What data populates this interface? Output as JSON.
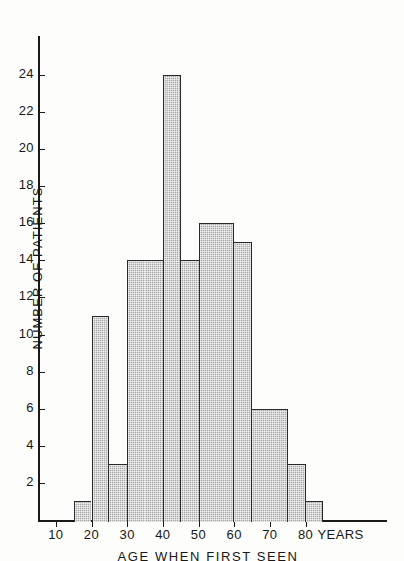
{
  "chart_data": {
    "type": "bar",
    "title": "",
    "subtitle": "",
    "xlabel": "AGE  WHEN  FIRST  SEEN",
    "ylabel": "NUMBER OF PATIENTS",
    "x_unit_label": "YEARS",
    "xlim": [
      5,
      85
    ],
    "ylim": [
      0,
      25
    ],
    "grid": false,
    "legend": null,
    "bin_width": 5,
    "categories": [
      "15-20",
      "20-25",
      "25-30",
      "30-35",
      "35-40",
      "40-45",
      "45-50",
      "50-55",
      "55-60",
      "60-65",
      "65-70",
      "70-75",
      "75-80",
      "80-85"
    ],
    "bin_starts": [
      15,
      20,
      25,
      30,
      35,
      40,
      45,
      50,
      55,
      60,
      65,
      70,
      75,
      80
    ],
    "values": [
      1,
      11,
      3,
      14,
      14,
      24,
      14,
      16,
      16,
      15,
      6,
      6,
      3,
      1
    ],
    "x_ticks": [
      10,
      20,
      30,
      40,
      50,
      60,
      70,
      80
    ],
    "x_tick_labels": [
      "10",
      "20",
      "30",
      "40",
      "50",
      "60",
      "70",
      "80"
    ],
    "y_ticks": [
      2,
      4,
      6,
      8,
      10,
      12,
      14,
      16,
      18,
      20,
      22,
      24
    ],
    "y_tick_labels": [
      "2",
      "4",
      "6",
      "8",
      "10",
      "12",
      "14",
      "16",
      "18",
      "20",
      "22",
      "24"
    ],
    "bar_fill_color": "#a8a8a8",
    "bar_edge_color": "#2a2a2a",
    "axis_color": "#1a1a1a",
    "background_color": "#fdfdfc"
  }
}
